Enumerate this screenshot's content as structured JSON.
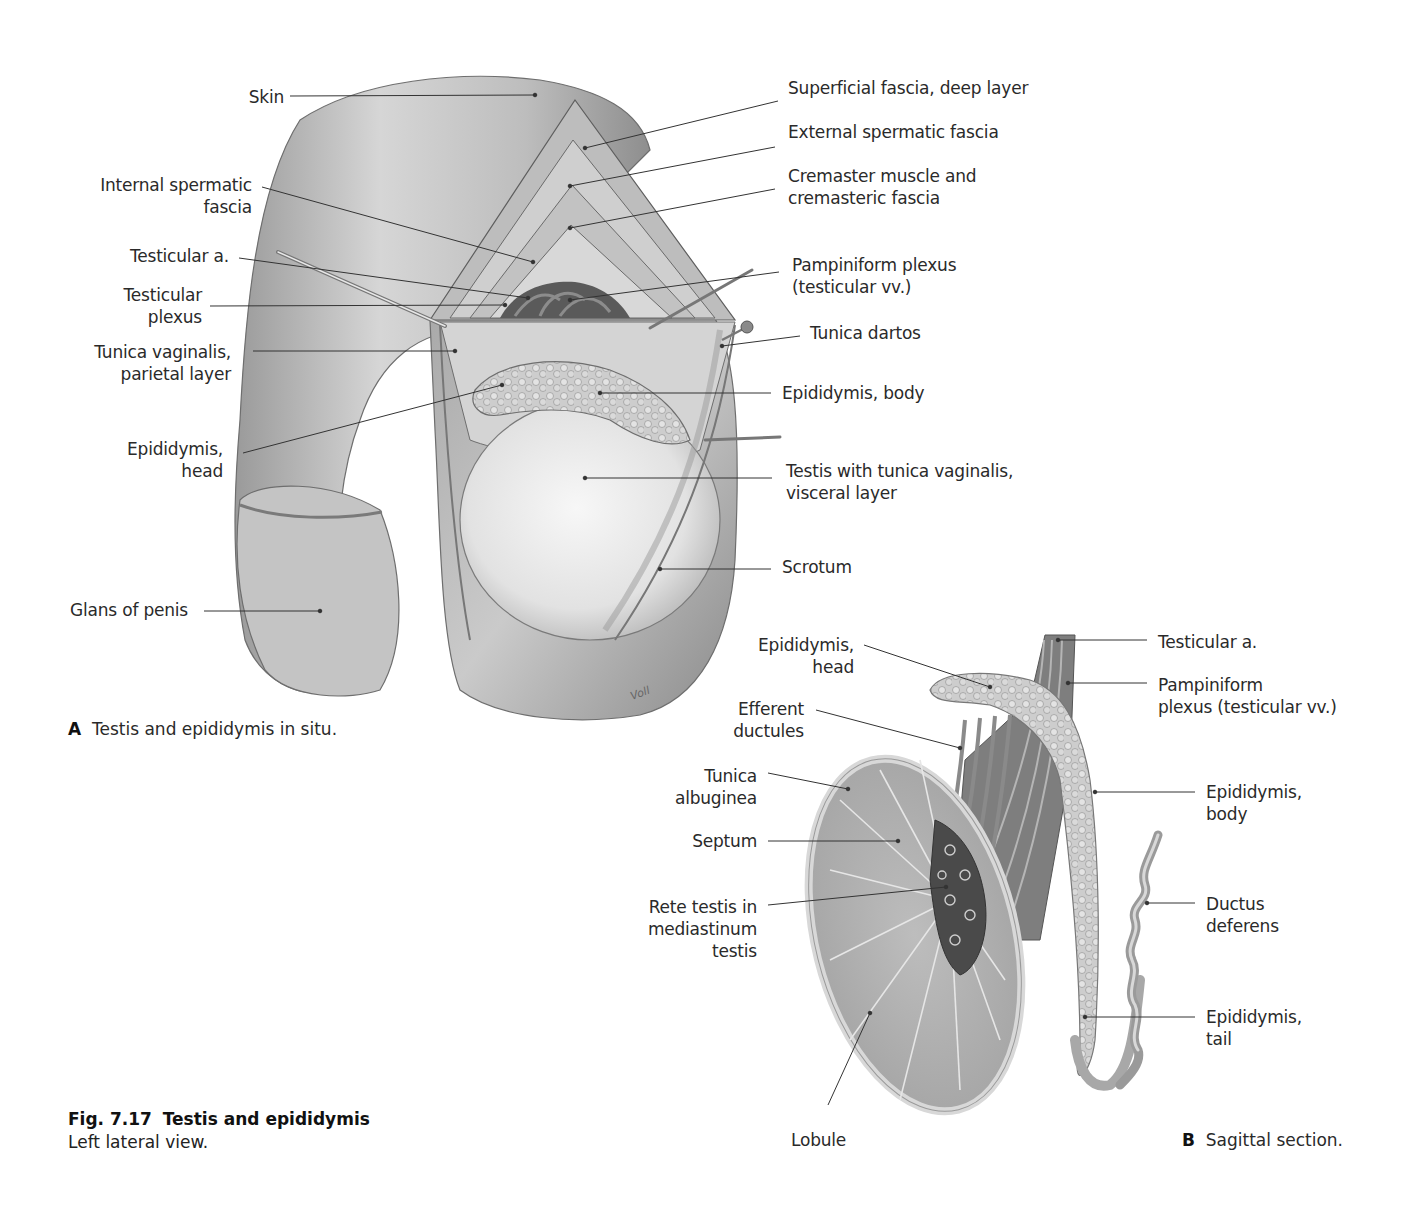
{
  "figure": {
    "number": "Fig. 7.17",
    "title": "Testis and epididymis",
    "subtitle": "Left lateral view."
  },
  "panel_a": {
    "letter": "A",
    "caption": "Testis and epididymis in situ.",
    "labels": [
      {
        "id": "skin",
        "text": "Skin",
        "x": 284,
        "y": 86,
        "align": "r",
        "line": [
          290,
          96,
          535,
          95
        ]
      },
      {
        "id": "internal-spermatic-fascia",
        "text": "Internal spermatic\nfascia",
        "x": 252,
        "y": 174,
        "align": "r",
        "line": [
          262,
          187,
          533,
          262
        ]
      },
      {
        "id": "testicular-a",
        "text": "Testicular a.",
        "x": 229,
        "y": 245,
        "align": "r",
        "line": [
          239,
          258,
          528,
          298
        ]
      },
      {
        "id": "testicular-plexus",
        "text": "Testicular\nplexus",
        "x": 202,
        "y": 284,
        "align": "r",
        "line": [
          210,
          306,
          505,
          305
        ]
      },
      {
        "id": "tunica-vaginalis-parietal",
        "text": "Tunica vaginalis,\nparietal layer",
        "x": 231,
        "y": 341,
        "align": "r",
        "line": [
          253,
          351,
          455,
          351
        ]
      },
      {
        "id": "epididymis-head-a",
        "text": "Epididymis,\nhead",
        "x": 223,
        "y": 438,
        "align": "r",
        "line": [
          243,
          453,
          502,
          385
        ]
      },
      {
        "id": "glans-of-penis",
        "text": "Glans of penis",
        "x": 188,
        "y": 599,
        "align": "r",
        "line": [
          204,
          611,
          320,
          611
        ]
      },
      {
        "id": "superficial-fascia-deep",
        "text": "Superficial fascia, deep layer",
        "x": 788,
        "y": 77,
        "align": "l",
        "line": [
          778,
          101,
          585,
          148
        ]
      },
      {
        "id": "external-spermatic-fascia",
        "text": "External spermatic fascia",
        "x": 788,
        "y": 121,
        "align": "l",
        "line": [
          775,
          147,
          570,
          186
        ]
      },
      {
        "id": "cremaster",
        "text": "Cremaster muscle and\ncremasteric fascia",
        "x": 788,
        "y": 165,
        "align": "l",
        "line": [
          775,
          189,
          570,
          228
        ]
      },
      {
        "id": "pampiniform-plexus-a",
        "text": "Pampiniform plexus\n(testicular vv.)",
        "x": 792,
        "y": 254,
        "align": "l",
        "line": [
          779,
          272,
          570,
          300
        ]
      },
      {
        "id": "tunica-dartos",
        "text": "Tunica dartos",
        "x": 810,
        "y": 322,
        "align": "l",
        "line": [
          800,
          336,
          722,
          346
        ]
      },
      {
        "id": "epididymis-body-a",
        "text": "Epididymis, body",
        "x": 782,
        "y": 382,
        "align": "l",
        "line": [
          771,
          393,
          600,
          393
        ]
      },
      {
        "id": "testis-tunica-visceral",
        "text": "Testis with tunica vaginalis,\nvisceral layer",
        "x": 786,
        "y": 460,
        "align": "l",
        "line": [
          772,
          478,
          585,
          478
        ]
      },
      {
        "id": "scrotum",
        "text": "Scrotum",
        "x": 782,
        "y": 556,
        "align": "l",
        "line": [
          771,
          569,
          660,
          569
        ]
      }
    ]
  },
  "panel_b": {
    "letter": "B",
    "caption": "Sagittal section.",
    "labels": [
      {
        "id": "epididymis-head-b",
        "text": "Epididymis,\nhead",
        "x": 854,
        "y": 634,
        "align": "r",
        "line": [
          864,
          645,
          990,
          687
        ]
      },
      {
        "id": "efferent-ductules",
        "text": "Efferent\nductules",
        "x": 804,
        "y": 698,
        "align": "r",
        "line": [
          816,
          710,
          960,
          748
        ]
      },
      {
        "id": "tunica-albuginea",
        "text": "Tunica\nalbuginea",
        "x": 757,
        "y": 765,
        "align": "r",
        "line": [
          768,
          773,
          848,
          789
        ]
      },
      {
        "id": "septum",
        "text": "Septum",
        "x": 757,
        "y": 830,
        "align": "r",
        "line": [
          768,
          841,
          898,
          841
        ]
      },
      {
        "id": "rete-testis",
        "text": "Rete testis in\nmediastinum\ntestis",
        "x": 757,
        "y": 896,
        "align": "r",
        "line": [
          768,
          905,
          946,
          887
        ]
      },
      {
        "id": "lobule",
        "text": "Lobule",
        "x": 791,
        "y": 1129,
        "align": "l",
        "line": [
          828,
          1105,
          870,
          1013
        ]
      },
      {
        "id": "testicular-a-b",
        "text": "Testicular a.",
        "x": 1158,
        "y": 631,
        "align": "l",
        "line": [
          1147,
          640,
          1058,
          640
        ]
      },
      {
        "id": "pampiniform-plexus-b",
        "text": "Pampiniform\nplexus (testicular vv.)",
        "x": 1158,
        "y": 674,
        "align": "l",
        "line": [
          1147,
          683,
          1068,
          683
        ]
      },
      {
        "id": "epididymis-body-b",
        "text": "Epididymis,\nbody",
        "x": 1206,
        "y": 781,
        "align": "l",
        "line": [
          1195,
          792,
          1095,
          792
        ]
      },
      {
        "id": "ductus-deferens",
        "text": "Ductus\ndeferens",
        "x": 1206,
        "y": 893,
        "align": "l",
        "line": [
          1195,
          903,
          1147,
          903
        ]
      },
      {
        "id": "epididymis-tail",
        "text": "Epididymis,\ntail",
        "x": 1206,
        "y": 1006,
        "align": "l",
        "line": [
          1195,
          1017,
          1085,
          1017
        ]
      }
    ]
  },
  "signature": "Voll",
  "colors": {
    "background": "#ffffff",
    "text": "#2a2a2a",
    "leader": "#333333",
    "skin_light": "#d9d9d9",
    "skin_mid": "#b5b5b5",
    "skin_dark": "#8c8c8c",
    "tissue": "#cfcfcf",
    "testis": "#ededed"
  }
}
